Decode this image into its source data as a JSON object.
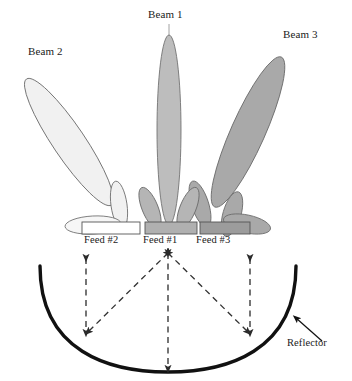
{
  "figure": {
    "type": "multibeam-reflector-antenna-diagram",
    "background": "#ffffff"
  },
  "beams": [
    {
      "id": "beam1",
      "label": "Beam 1",
      "fill": "#bdbdbd",
      "stroke": "#6b6b6b",
      "tilt_deg": 0,
      "feed": "Feed #1"
    },
    {
      "id": "beam2",
      "label": "Beam 2",
      "fill": "#f1f1f1",
      "stroke": "#6b6b6b",
      "tilt_deg": -34,
      "feed": "Feed #2"
    },
    {
      "id": "beam3",
      "label": "Beam 3",
      "fill": "#a9a9a9",
      "stroke": "#6b6b6b",
      "tilt_deg": 24,
      "feed": "Feed #3"
    }
  ],
  "feeds": [
    {
      "id": "feed2",
      "label": "Feed #2",
      "fill": "#ffffff",
      "stroke": "#555555"
    },
    {
      "id": "feed1",
      "label": "Feed #1",
      "fill": "#b0b0b0",
      "stroke": "#555555"
    },
    {
      "id": "feed3",
      "label": "Feed #3",
      "fill": "#9c9c9c",
      "stroke": "#555555"
    }
  ],
  "reflector": {
    "label": "Reflector",
    "stroke": "#111111",
    "stroke_width": 3.4
  },
  "rays": {
    "stroke": "#333333",
    "style": "dashed",
    "arrowheads": "double",
    "count": 5
  }
}
